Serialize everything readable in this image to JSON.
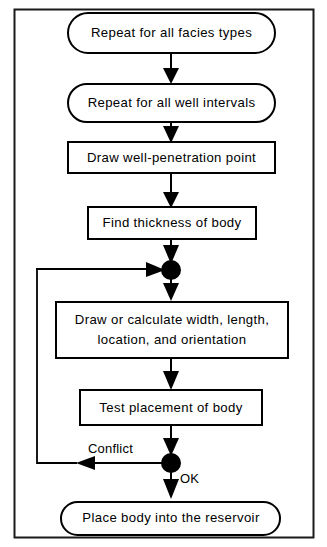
{
  "figure": {
    "type": "flowchart",
    "border_color": "#1a1a1a",
    "line_color": "#000000",
    "fill_color": "#ffffff"
  },
  "nodes": [
    {
      "id": "n1",
      "label": "Repeat for all facies types",
      "shape": "stadium"
    },
    {
      "id": "n2",
      "label": "Repeat for all well intervals",
      "shape": "stadium"
    },
    {
      "id": "n3",
      "label": "Draw well-penetration point",
      "shape": "rect"
    },
    {
      "id": "n4",
      "label": "Find thickness of body",
      "shape": "rect"
    },
    {
      "id": "n5",
      "label_line1": "Draw or calculate width, length,",
      "label_line2": "location, and orientation",
      "shape": "rect"
    },
    {
      "id": "n6",
      "label": "Test placement of body",
      "shape": "rect"
    },
    {
      "id": "n7",
      "label": "Place body into the reservoir",
      "shape": "stadium"
    }
  ],
  "junctions": [
    {
      "id": "j1",
      "name": "loop-entry-junction"
    },
    {
      "id": "j2",
      "name": "decision-junction"
    }
  ],
  "edge_labels": {
    "conflict": "Conflict",
    "ok": "OK"
  }
}
